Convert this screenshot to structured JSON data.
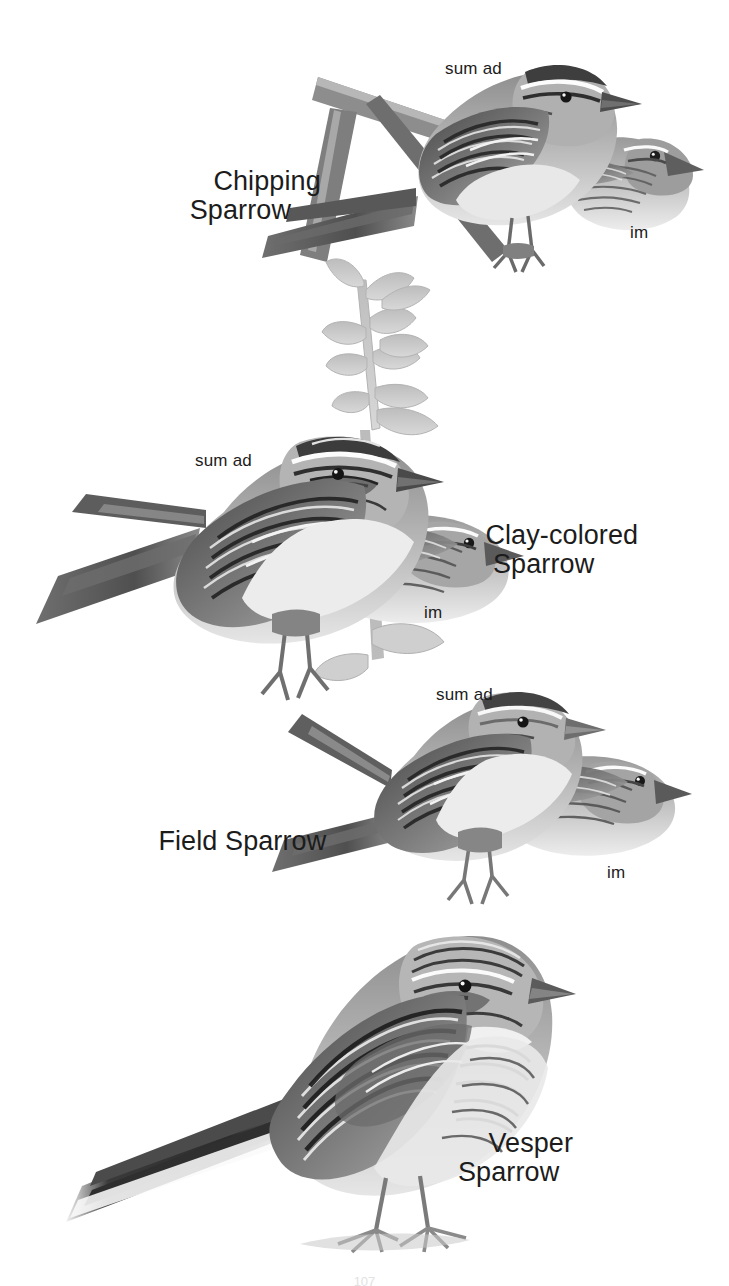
{
  "plate": {
    "title": "Sparrows plate",
    "page_number": "107",
    "background_color": "#ffffff",
    "ink_color": "#1c1c1c"
  },
  "species": [
    {
      "id": "chipping-sparrow",
      "name_line1": "Chipping",
      "name_line2": "Sparrow",
      "age_labels": {
        "adult": "sum ad",
        "immature": "im"
      }
    },
    {
      "id": "clay-colored-sparrow",
      "name_line1": "Clay-colored",
      "name_line2": "Sparrow",
      "age_labels": {
        "adult": "sum ad",
        "immature": "im"
      }
    },
    {
      "id": "field-sparrow",
      "name_line1": "Field Sparrow",
      "name_line2": "",
      "age_labels": {
        "adult": "sum ad",
        "immature": "im"
      }
    },
    {
      "id": "vesper-sparrow",
      "name_line1": "Vesper",
      "name_line2": "Sparrow",
      "age_labels": {
        "adult": "",
        "immature": ""
      }
    }
  ]
}
